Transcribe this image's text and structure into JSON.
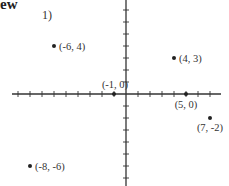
{
  "heading": "ew",
  "problem_number": "1)",
  "chart_data": {
    "type": "scatter",
    "title": "",
    "xlabel": "",
    "ylabel": "",
    "xlim": [
      -9,
      8
    ],
    "ylim": [
      -7,
      7
    ],
    "grid": false,
    "axes": "cartesian-centered",
    "points": [
      {
        "x": -6,
        "y": 4,
        "label": "(-6, 4)"
      },
      {
        "x": 4,
        "y": 3,
        "label": "(4, 3)"
      },
      {
        "x": -1,
        "y": 0,
        "label": "(-1, 0)"
      },
      {
        "x": 5,
        "y": 0,
        "label": "(5, 0)"
      },
      {
        "x": 7,
        "y": -2,
        "label": "(7, -2)"
      },
      {
        "x": -8,
        "y": -6,
        "label": "(-8, -6)"
      }
    ]
  }
}
